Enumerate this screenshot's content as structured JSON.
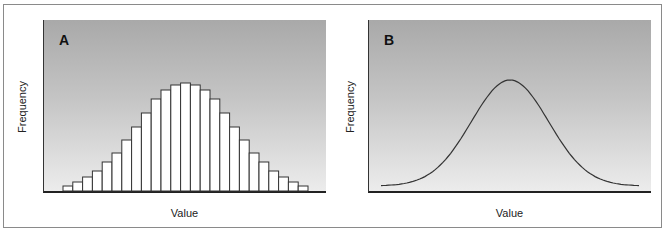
{
  "panels": [
    {
      "label": "A",
      "xlabel": "Value",
      "ylabel": "Frequency"
    },
    {
      "label": "B",
      "xlabel": "Value",
      "ylabel": "Frequency"
    }
  ],
  "chart_data": [
    {
      "type": "bar",
      "title": "A",
      "xlabel": "Value",
      "ylabel": "Frequency",
      "grid": false,
      "categories": [
        "1",
        "2",
        "3",
        "4",
        "5",
        "6",
        "7",
        "8",
        "9",
        "10",
        "11",
        "12",
        "13",
        "14",
        "15",
        "16",
        "17",
        "18",
        "19",
        "20",
        "21",
        "22",
        "23",
        "24",
        "25"
      ],
      "values": [
        5,
        9,
        14,
        20,
        29,
        38,
        51,
        64,
        78,
        92,
        101,
        106,
        108,
        106,
        101,
        92,
        78,
        64,
        51,
        38,
        29,
        20,
        14,
        9,
        5
      ],
      "note": "Relative bar heights (px-scaled); axes carry no numeric ticks"
    },
    {
      "type": "line",
      "title": "B",
      "xlabel": "Value",
      "ylabel": "Frequency",
      "grid": false,
      "description": "Smooth bell-shaped (normal) curve, symmetric about center",
      "x": [
        0,
        0.1,
        0.2,
        0.3,
        0.4,
        0.5,
        0.6,
        0.7,
        0.8,
        0.9,
        1.0
      ],
      "values": [
        4,
        10,
        25,
        52,
        85,
        108,
        85,
        52,
        25,
        10,
        4
      ]
    }
  ]
}
